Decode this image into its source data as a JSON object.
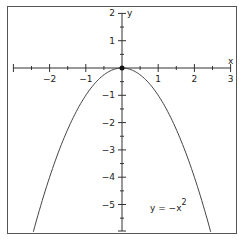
{
  "chart_data": {
    "type": "line",
    "title": "",
    "xlabel": "x",
    "ylabel": "y",
    "xlim": [
      -3.05,
      3.2
    ],
    "ylim": [
      -6.0,
      2.2
    ],
    "grid": false,
    "x_ticks": [
      -2,
      -1,
      1,
      2,
      3
    ],
    "x_tick_labels": [
      "−2",
      "−1",
      "1",
      "2",
      "3"
    ],
    "y_ticks": [
      2,
      1,
      -1,
      -2,
      -3,
      -4,
      -5
    ],
    "y_tick_labels": [
      "2",
      "1",
      "−1",
      "−2",
      "−3",
      "−4",
      "−5"
    ],
    "series": [
      {
        "name": "y = -x^2",
        "function": "y = -x^2",
        "x": [
          -2.45,
          -2,
          -1.5,
          -1,
          -0.5,
          0,
          0.5,
          1,
          1.5,
          2,
          2.45
        ],
        "y": [
          -6.0,
          -4,
          -2.25,
          -1,
          -0.25,
          0,
          -0.25,
          -1,
          -2.25,
          -4,
          -6.0
        ]
      }
    ],
    "annotations": [
      {
        "text": "y = −x",
        "superscript": "2",
        "x": 1.2,
        "y": -5.3
      }
    ],
    "points": [
      {
        "x": 0,
        "y": 0,
        "label": "vertex"
      }
    ],
    "legend": "none"
  },
  "labels": {
    "x_axis": "x",
    "y_axis": "y",
    "equation_base": "y = −x",
    "equation_exp": "2"
  }
}
